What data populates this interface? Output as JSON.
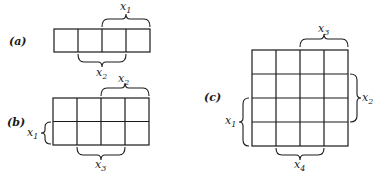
{
  "figure": {
    "panels": [
      {
        "id": "a",
        "label": "(a)",
        "rows": 1,
        "cols": 4,
        "braces": [
          {
            "var": "x",
            "sub": "1",
            "side": "top",
            "span": "columns 3-4"
          },
          {
            "var": "x",
            "sub": "2",
            "side": "bottom",
            "span": "columns 2-3"
          }
        ]
      },
      {
        "id": "b",
        "label": "(b)",
        "rows": 2,
        "cols": 4,
        "braces": [
          {
            "var": "x",
            "sub": "2",
            "side": "top",
            "span": "columns 3-4"
          },
          {
            "var": "x",
            "sub": "1",
            "side": "left",
            "span": "row 2"
          },
          {
            "var": "x",
            "sub": "3",
            "side": "bottom",
            "span": "columns 2-3"
          }
        ]
      },
      {
        "id": "c",
        "label": "(c)",
        "rows": 4,
        "cols": 4,
        "braces": [
          {
            "var": "x",
            "sub": "3",
            "side": "top",
            "span": "columns 3-4"
          },
          {
            "var": "x",
            "sub": "2",
            "side": "right",
            "span": "rows 2-3"
          },
          {
            "var": "x",
            "sub": "1",
            "side": "left",
            "span": "rows 3-4"
          },
          {
            "var": "x",
            "sub": "4",
            "side": "bottom",
            "span": "columns 2-3"
          }
        ]
      }
    ]
  }
}
